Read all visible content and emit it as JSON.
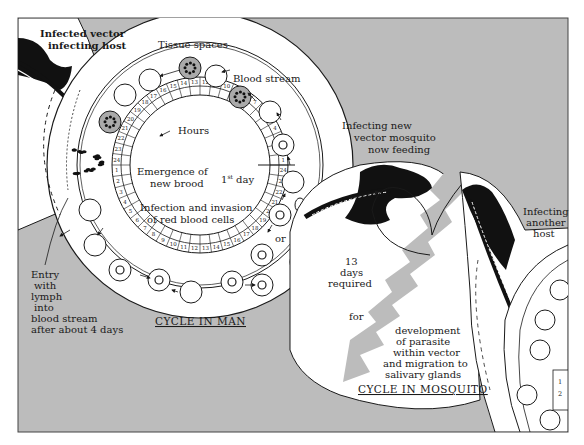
{
  "diagram": {
    "colors": {
      "background": "#bcbcbc",
      "panel": "#ffffff",
      "ink": "#1a1a1a"
    },
    "cycle_in_man": {
      "title": "CYCLE IN MAN",
      "tissue_label": "Tissue spaces",
      "blood_label": "Blood stream",
      "hours_label": "Hours",
      "day_label_prefix": "1",
      "day_label_sup": "st",
      "day_label_suffix": " day",
      "emergence_line1": "Emergence of",
      "emergence_line2": "new brood",
      "invasion_line1": "Infection and invasion",
      "invasion_line2": "of red blood cells",
      "or_label": "or",
      "hour_ring_outer": [
        "1",
        "2",
        "3",
        "4",
        "5",
        "6",
        "7",
        "8",
        "9",
        "10",
        "11",
        "12",
        "13",
        "14",
        "15",
        "16",
        "17",
        "18",
        "19",
        "20",
        "21",
        "22",
        "23",
        "24"
      ],
      "hour_ring_inner": [
        "1",
        "2",
        "3",
        "4",
        "5",
        "6",
        "7",
        "8",
        "9",
        "10",
        "11",
        "12",
        "13",
        "14",
        "15",
        "16",
        "17",
        "18",
        "19",
        "20",
        "21",
        "22",
        "23",
        "24"
      ]
    },
    "top_left_label_line1": "Infected vector",
    "top_left_label_line2": "infecting host",
    "entry_label": [
      "Entry",
      "with",
      "lymph",
      "into",
      "blood stream",
      "after about 4 days"
    ],
    "new_vector_label": [
      "Infecting new",
      "vector mosquito",
      "now feeding"
    ],
    "cycle_in_mosquito": {
      "title": "CYCLE IN MOSQUITO",
      "days_label": [
        "13",
        "days",
        "required"
      ],
      "for_label": "for",
      "development_label": [
        "development",
        "of parasite",
        "within vector",
        "and migration to",
        "salivary glands"
      ]
    },
    "another_host_label": [
      "Infecting",
      "another",
      "host"
    ],
    "right_mini_ring": [
      "1",
      "2"
    ]
  }
}
